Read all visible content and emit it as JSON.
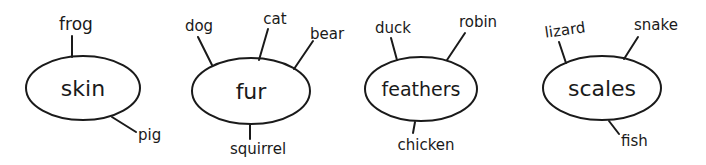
{
  "diagram": {
    "type": "concept-web",
    "colors": {
      "ink": "#1a1a1a",
      "background": "#ffffff"
    },
    "clusters": [
      {
        "category": "skin",
        "animals": [
          "frog",
          "pig"
        ]
      },
      {
        "category": "fur",
        "animals": [
          "dog",
          "cat",
          "bear",
          "squirrel"
        ]
      },
      {
        "category": "feathers",
        "animals": [
          "duck",
          "robin",
          "chicken"
        ]
      },
      {
        "category": "scales",
        "animals": [
          "lizard",
          "snake",
          "fish"
        ]
      }
    ]
  }
}
